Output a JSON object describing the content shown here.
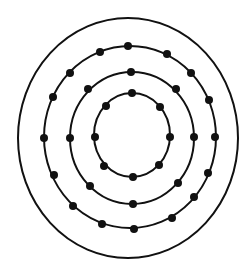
{
  "diagram": {
    "colors": {
      "background": "#ffffff",
      "stroke": "#111111",
      "dot": "#111111"
    },
    "outer_boundary": {
      "cx": 128,
      "cy": 138,
      "rx": 110,
      "ry": 120
    },
    "rings": [
      {
        "name": "inner-ring",
        "cx": 132,
        "cy": 135,
        "rx": 38,
        "ry": 42,
        "dot_count": 8,
        "dots": [
          [
            132,
            93
          ],
          [
            106,
            106
          ],
          [
            95,
            137
          ],
          [
            104,
            166
          ],
          [
            133,
            177
          ],
          [
            159,
            165
          ],
          [
            170,
            137
          ],
          [
            160,
            107
          ]
        ]
      },
      {
        "name": "middle-ring",
        "cx": 132,
        "cy": 138,
        "rx": 62,
        "ry": 66,
        "dot_count": 8,
        "dots": [
          [
            131,
            72
          ],
          [
            88,
            89
          ],
          [
            70,
            138
          ],
          [
            90,
            186
          ],
          [
            133,
            204
          ],
          [
            178,
            183
          ],
          [
            194,
            137
          ],
          [
            176,
            89
          ]
        ]
      },
      {
        "name": "outer-ring",
        "cx": 130,
        "cy": 137,
        "rx": 86,
        "ry": 91,
        "dot_count": 16,
        "dots": [
          [
            128,
            46
          ],
          [
            100,
            52
          ],
          [
            70,
            73
          ],
          [
            53,
            97
          ],
          [
            44,
            138
          ],
          [
            54,
            175
          ],
          [
            73,
            206
          ],
          [
            102,
            224
          ],
          [
            134,
            229
          ],
          [
            172,
            218
          ],
          [
            194,
            197
          ],
          [
            208,
            173
          ],
          [
            215,
            137
          ],
          [
            209,
            100
          ],
          [
            191,
            73
          ],
          [
            167,
            54
          ]
        ]
      }
    ],
    "dot_radius": 4
  }
}
